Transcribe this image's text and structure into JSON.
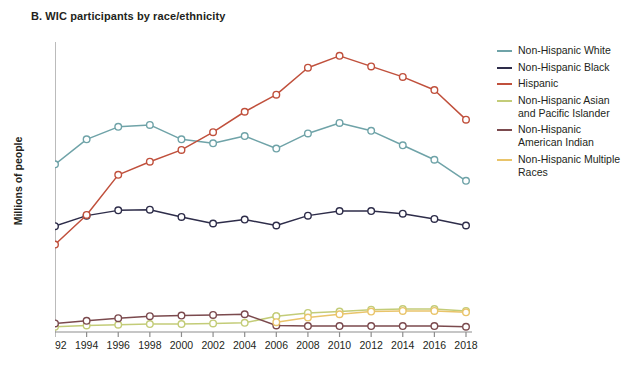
{
  "chart_data": {
    "type": "line",
    "title": "B. WIC participants by race/ethnicity",
    "xlabel": "",
    "ylabel": "Millions of people",
    "x": [
      1992,
      1994,
      1996,
      1998,
      2000,
      2002,
      2004,
      2006,
      2008,
      2010,
      2012,
      2014,
      2016,
      2018
    ],
    "xtick_labels": [
      "1992",
      "1994",
      "1996",
      "1998",
      "2000",
      "2002",
      "2004",
      "2006",
      "2008",
      "2010",
      "2012",
      "2014",
      "2016",
      "2018"
    ],
    "ytick_labels": [
      "0",
      "1",
      "2",
      "3",
      "4"
    ],
    "ytick_values": [
      0,
      1,
      2,
      3,
      4
    ],
    "ylim": [
      0,
      4.35
    ],
    "xlim": [
      1992,
      2018
    ],
    "grid": false,
    "legend_position": "right",
    "series": [
      {
        "name": "Non-Hispanic White",
        "color": "#6fa3a8",
        "values": [
          2.55,
          2.93,
          3.12,
          3.15,
          2.93,
          2.87,
          2.98,
          2.79,
          3.02,
          3.18,
          3.06,
          2.84,
          2.62,
          2.3
        ]
      },
      {
        "name": "Non-Hispanic Black",
        "color": "#2e2d4a",
        "values": [
          1.61,
          1.77,
          1.85,
          1.86,
          1.75,
          1.65,
          1.71,
          1.62,
          1.77,
          1.84,
          1.84,
          1.8,
          1.72,
          1.62
        ]
      },
      {
        "name": "Hispanic",
        "color": "#c0503c",
        "values": [
          1.33,
          1.78,
          2.39,
          2.59,
          2.77,
          3.04,
          3.35,
          3.61,
          4.02,
          4.2,
          4.04,
          3.88,
          3.68,
          3.23
        ]
      },
      {
        "name": "Non-Hispanic Asian and Pacific Islander",
        "color": "#c3cc78",
        "values": [
          null,
          null,
          null,
          null,
          null,
          null,
          null,
          0.24,
          0.29,
          0.31,
          0.34,
          0.35,
          0.35,
          0.32
        ]
      },
      {
        "name": "Non-Hispanic American Indian",
        "color": "#7b4a4e",
        "values": [
          0.13,
          0.17,
          0.21,
          0.24,
          0.25,
          0.26,
          0.27,
          0.1,
          0.09,
          0.09,
          0.09,
          0.09,
          0.09,
          0.08
        ]
      },
      {
        "name": "Non-Hispanic Multiple Races",
        "color": "#e9c46a",
        "values": [
          null,
          null,
          null,
          null,
          null,
          null,
          null,
          0.15,
          0.22,
          0.27,
          0.31,
          0.32,
          0.32,
          0.3
        ]
      }
    ],
    "pre2006_asian_note": {
      "name": "Non-Hispanic Asian and Pacific Islander (pre-2006)",
      "color": "#c3cc78",
      "values": [
        0.08,
        0.1,
        0.11,
        0.12,
        0.12,
        0.13,
        0.14,
        0.24,
        null,
        null,
        null,
        null,
        null,
        null
      ]
    }
  },
  "legend": {
    "items": [
      {
        "label": "Non-Hispanic White",
        "color": "#6fa3a8"
      },
      {
        "label": "Non-Hispanic Black",
        "color": "#2e2d4a"
      },
      {
        "label": "Hispanic",
        "color": "#c0503c"
      },
      {
        "label": "Non-Hispanic Asian and Pacific Islander",
        "color": "#c3cc78"
      },
      {
        "label": "Non-Hispanic American Indian",
        "color": "#7b4a4e"
      },
      {
        "label": "Non-Hispanic Multiple Races",
        "color": "#e9c46a"
      }
    ]
  }
}
